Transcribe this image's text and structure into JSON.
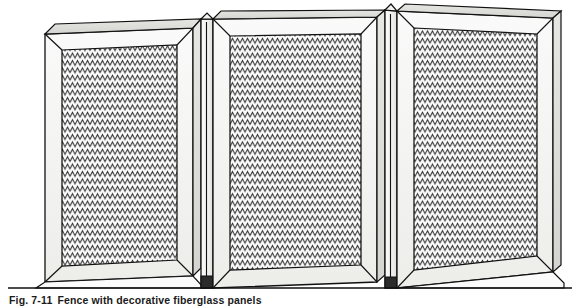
{
  "figure": {
    "caption_number": "Fig. 7-11",
    "caption_text": "Fence with decorative fiberglass panels"
  },
  "colors": {
    "background": "#ffffff",
    "line": "#111111",
    "frame_face_light": "#f2f2f0",
    "frame_face_shadow": "#d8d8d4",
    "panel_fill": "#fbfbfb",
    "panel_pattern": "#2b2b2b",
    "ground_line": "#111111"
  },
  "structure": {
    "section_count": 3,
    "post_count": 2,
    "panel_texture": "corrugated-zigzag",
    "ground_label": "ground line"
  },
  "sections": [
    {
      "name": "fence-section-left",
      "frame_label": "mitered wood frame",
      "panel_label": "corrugated fiberglass panel"
    },
    {
      "name": "fence-section-center",
      "frame_label": "mitered wood frame",
      "panel_label": "corrugated fiberglass panel"
    },
    {
      "name": "fence-section-right",
      "frame_label": "mitered wood frame",
      "panel_label": "corrugated fiberglass panel"
    }
  ],
  "posts": [
    {
      "name": "fence-post-left",
      "label": "intermediate post"
    },
    {
      "name": "fence-post-right",
      "label": "intermediate post"
    }
  ]
}
